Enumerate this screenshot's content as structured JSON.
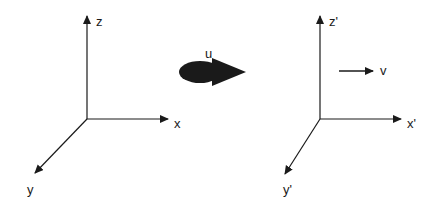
{
  "diagram": {
    "left_frame": {
      "axes": {
        "z_label": "z",
        "x_label": "x",
        "y_label": "y"
      }
    },
    "transform_arrow": {
      "label": "u",
      "icon": "bold-right-arrow-icon"
    },
    "right_frame": {
      "axes": {
        "z_label": "z'",
        "x_label": "x'",
        "y_label": "y'"
      },
      "velocity_arrow": {
        "label": "v"
      }
    },
    "colors": {
      "ink": "#1a1a1a",
      "background": "#ffffff"
    }
  }
}
